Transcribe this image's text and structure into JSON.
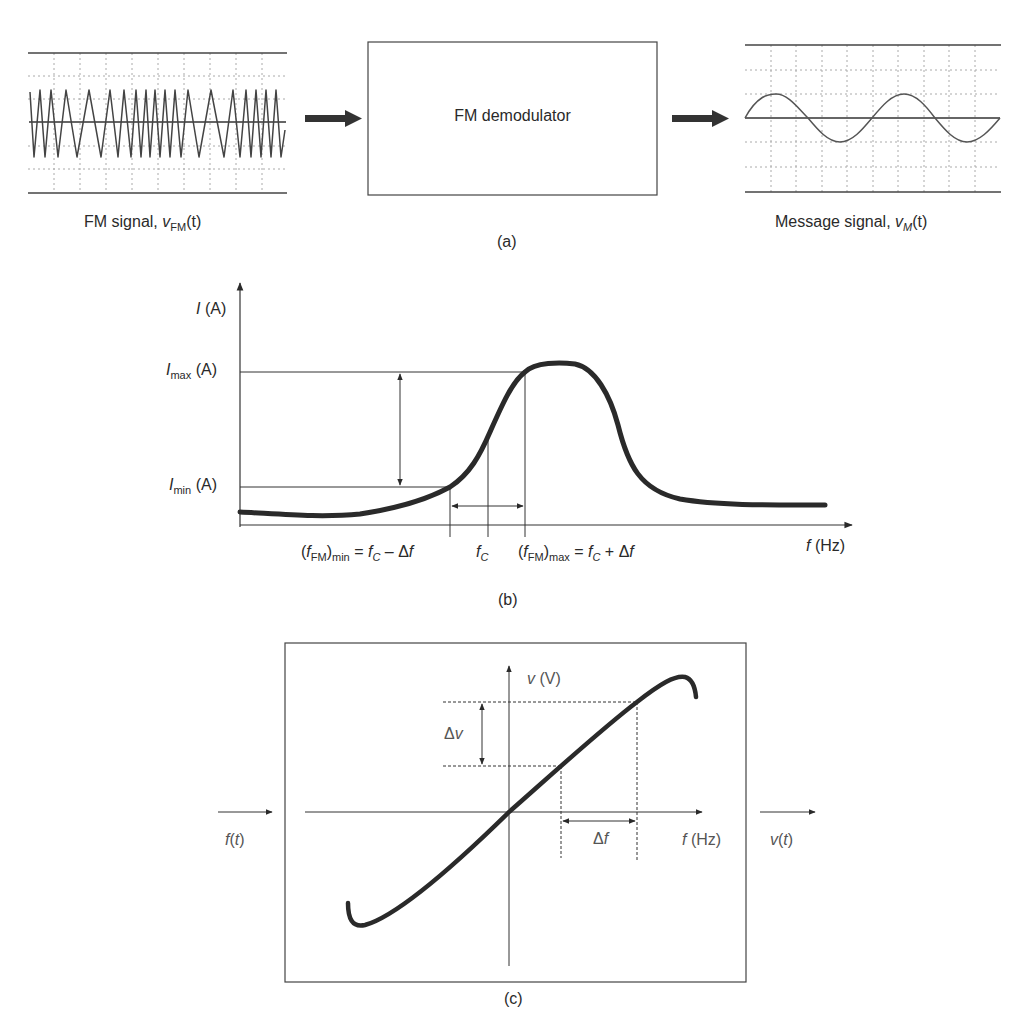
{
  "panel_a": {
    "caption": "(a)",
    "input_label": {
      "prefix": "FM signal, ",
      "var": "v",
      "sub": "FM",
      "arg": "(t)"
    },
    "block_label": "FM demodulator",
    "output_label": {
      "prefix": "Message signal, ",
      "var": "v",
      "sub": "M",
      "arg": "(t)"
    }
  },
  "panel_b": {
    "caption": "(b)",
    "y_axis_label": {
      "var": "I",
      "unit": " (A)"
    },
    "x_axis_label": {
      "var": "f",
      "unit": " (Hz)"
    },
    "imax_label": {
      "var": "I",
      "sub": "max",
      "unit": " (A)"
    },
    "imin_label": {
      "var": "I",
      "sub": "min",
      "unit": " (A)"
    },
    "fmin_label": {
      "open": "(",
      "var": "f",
      "sub1": "FM",
      "close": ")",
      "sub2": "min",
      "eq": " = ",
      "fc": "f",
      "fcsub": "C",
      "op": " – Δ",
      "df": "f"
    },
    "fc_label": {
      "var": "f",
      "sub": "C"
    },
    "fmax_label": {
      "open": "(",
      "var": "f",
      "sub1": "FM",
      "close": ")",
      "sub2": "max",
      "eq": " = ",
      "fc": "f",
      "fcsub": "C",
      "op": " + Δ",
      "df": "f"
    }
  },
  "panel_c": {
    "caption": "(c)",
    "y_axis_label": {
      "var": "v",
      "unit": " (V)"
    },
    "x_axis_label": {
      "var": "f",
      "unit": " (Hz)"
    },
    "dv_label": {
      "delta": "Δ",
      "var": "v"
    },
    "df_label": {
      "delta": "Δ",
      "var": "f"
    },
    "input_label": {
      "var": "f",
      "arg_open": "(",
      "arg": "t",
      "arg_close": ")"
    },
    "output_label": {
      "var": "v",
      "arg_open": "(",
      "arg": "t",
      "arg_close": ")"
    }
  },
  "colors": {
    "ink": "#2a2a2a",
    "grid": "#9a9a9a",
    "curve": "#333333"
  }
}
